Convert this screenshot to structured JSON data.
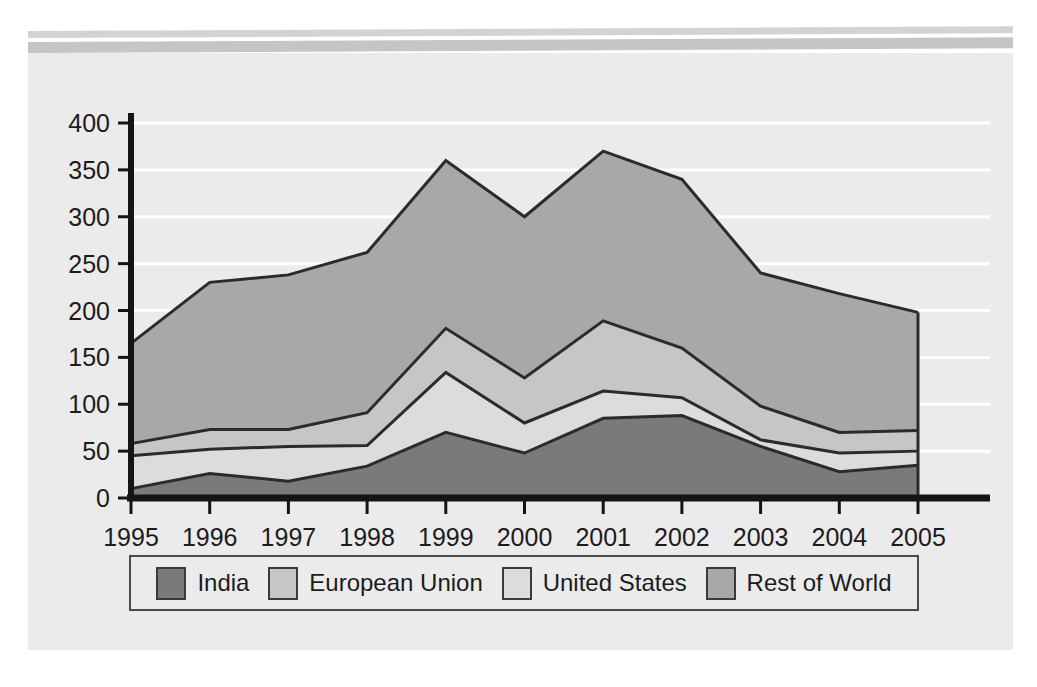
{
  "banner": {
    "bar_top_color": "#d2d4d4",
    "bar_bottom_color": "#c3c6c6"
  },
  "card": {
    "background_color": "#ebebeb"
  },
  "legend": {
    "items": [
      {
        "label": "India",
        "color": "#7a7a7a"
      },
      {
        "label": "European Union",
        "color": "#c6c6c6"
      },
      {
        "label": "United States",
        "color": "#dcdcdc"
      },
      {
        "label": "Rest of World",
        "color": "#a8a8a8"
      }
    ]
  },
  "chart_data": {
    "type": "area",
    "stacked": true,
    "title": "",
    "subtitle": "",
    "xlabel": "",
    "ylabel": "",
    "grid": true,
    "grid_color": "#ffffff",
    "legend_position": "bottom",
    "axis_color": "#141414",
    "series_line_color": "#2b2b2b",
    "xlim": [
      1995,
      2005
    ],
    "ylim": [
      0,
      400
    ],
    "yticks": [
      0,
      50,
      100,
      150,
      200,
      250,
      300,
      350,
      400
    ],
    "ytick_labels": [
      "0",
      "50",
      "100",
      "150",
      "200",
      "250",
      "300",
      "350",
      "400"
    ],
    "categories": [
      1995,
      1996,
      1997,
      1998,
      1999,
      2000,
      2001,
      2002,
      2003,
      2004,
      2005
    ],
    "xtick_labels": [
      "1995",
      "1996",
      "1997",
      "1998",
      "1999",
      "2000",
      "2001",
      "2002",
      "2003",
      "2004",
      "2005"
    ],
    "series": [
      {
        "name": "India",
        "color": "#7a7a7a",
        "values": [
          10,
          26,
          18,
          34,
          70,
          48,
          85,
          88,
          55,
          28,
          35
        ]
      },
      {
        "name": "United States",
        "color": "#dcdcdc",
        "values": [
          35,
          26,
          37,
          22,
          64,
          32,
          29,
          19,
          7,
          20,
          15
        ]
      },
      {
        "name": "European Union",
        "color": "#c6c6c6",
        "values": [
          13,
          21,
          18,
          35,
          47,
          48,
          75,
          53,
          36,
          22,
          22
        ]
      },
      {
        "name": "Rest of World",
        "color": "#a8a8a8",
        "values": [
          107,
          157,
          165,
          171,
          179,
          172,
          181,
          180,
          142,
          148,
          126
        ]
      }
    ],
    "cumulative_tops": {
      "India": [
        10,
        26,
        18,
        34,
        70,
        48,
        85,
        88,
        55,
        28,
        35
      ],
      "United States": [
        45,
        52,
        55,
        56,
        134,
        80,
        114,
        107,
        62,
        48,
        50
      ],
      "European Union": [
        58,
        73,
        73,
        91,
        181,
        128,
        189,
        160,
        98,
        70,
        72
      ],
      "Rest of World": [
        165,
        230,
        238,
        262,
        360,
        300,
        370,
        340,
        240,
        218,
        198
      ]
    }
  }
}
